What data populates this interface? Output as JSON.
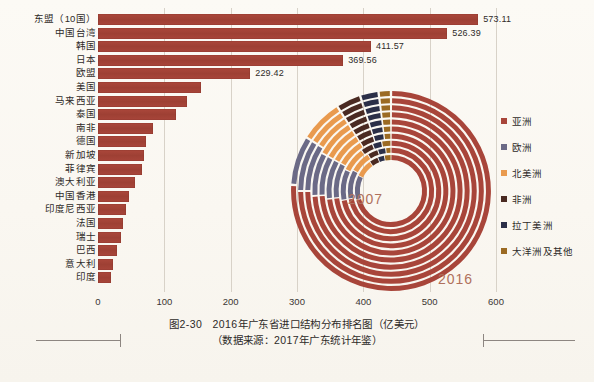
{
  "chart_data": {
    "type": "bar",
    "title": "2016年广东省进口结构分布排名图（亿美元）",
    "source": "（数据来源：2017年广东统计年鉴）",
    "figure_number": "图2-30",
    "xlabel": "",
    "ylabel": "",
    "unit": "亿美元",
    "xlim": [
      0,
      600
    ],
    "xticks": [
      "0",
      "100",
      "200",
      "300",
      "400",
      "500",
      "600"
    ],
    "grid": true,
    "bar_color": "#a8453a",
    "categories": [
      "东盟（10国）",
      "中国台湾",
      "韩国",
      "日本",
      "欧盟",
      "美国",
      "马来西亚",
      "泰国",
      "南非",
      "德国",
      "新加坡",
      "菲律宾",
      "澳大利亚",
      "中国香港",
      "印度尼西亚",
      "法国",
      "瑞士",
      "巴西",
      "意大利",
      "印度"
    ],
    "values": [
      573.11,
      526.39,
      411.57,
      369.56,
      229.42,
      155.0,
      134.0,
      118.0,
      83.0,
      72.0,
      69.0,
      66.0,
      56.0,
      46.0,
      42.0,
      37.0,
      34.0,
      29.0,
      23.0,
      20.0
    ],
    "value_labels": [
      "573.11",
      "526.39",
      "411.57",
      "369.56",
      "229.42"
    ],
    "labeled_count": 5,
    "donut": {
      "type": "pie",
      "center_label_inner": "2007",
      "center_label_outer": "2016",
      "rings": [
        "2007",
        "2008",
        "2009",
        "2010",
        "2011",
        "2012",
        "2013",
        "2014",
        "2015",
        "2016"
      ],
      "legend_position": "right",
      "series": [
        {
          "name": "亚洲",
          "color": "#a8453a",
          "values": [
            71,
            72,
            72,
            73,
            73,
            74,
            74,
            75,
            75,
            76
          ]
        },
        {
          "name": "欧洲",
          "color": "#6b6a86",
          "values": [
            11,
            11,
            10,
            10,
            10,
            9,
            9,
            9,
            9,
            8
          ]
        },
        {
          "name": "北美洲",
          "color": "#e99a4e",
          "values": [
            8,
            8,
            8,
            8,
            8,
            8,
            8,
            7,
            7,
            7
          ]
        },
        {
          "name": "非洲",
          "color": "#4a2a22",
          "values": [
            4,
            4,
            4,
            4,
            4,
            4,
            4,
            4,
            4,
            4
          ]
        },
        {
          "name": "拉丁美洲",
          "color": "#2b2f48",
          "values": [
            3,
            3,
            3,
            3,
            3,
            3,
            3,
            3,
            3,
            3
          ]
        },
        {
          "name": "大洋洲及其他",
          "color": "#9b6a23",
          "values": [
            3,
            2,
            3,
            2,
            2,
            2,
            2,
            2,
            2,
            2
          ]
        }
      ]
    }
  },
  "legend": {
    "items": [
      {
        "label": "亚洲",
        "color": "#a8453a"
      },
      {
        "label": "欧洲",
        "color": "#6b6a86"
      },
      {
        "label": "北美洲",
        "color": "#e99a4e"
      },
      {
        "label": "非洲",
        "color": "#4a2a22"
      },
      {
        "label": "拉丁美洲",
        "color": "#2b2f48"
      },
      {
        "label": "大洋洲及其他",
        "color": "#9b6a23"
      }
    ]
  },
  "caption": {
    "line1": "图2-30　2016年广东省进口结构分布排名图（亿美元）",
    "line2": "（数据来源：2017年广东统计年鉴）"
  }
}
